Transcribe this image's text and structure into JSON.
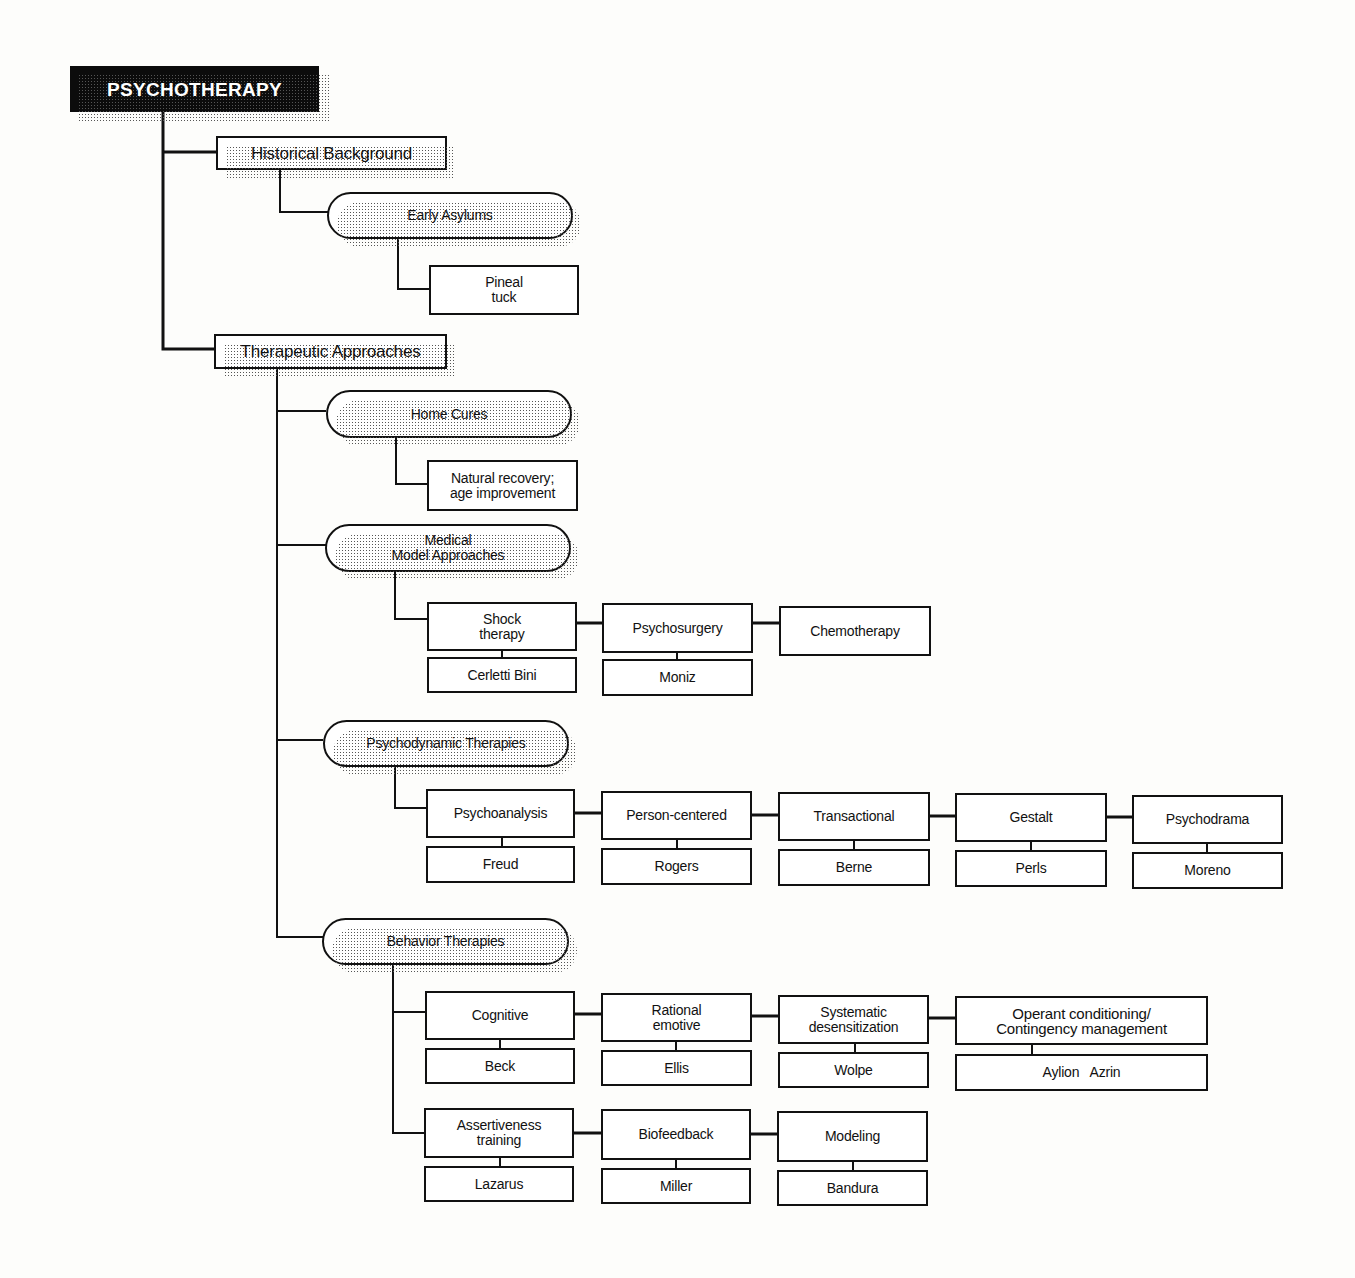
{
  "diagram": {
    "root": "PSYCHOTHERAPY",
    "historical": {
      "label": "Historical Background",
      "early_asylums": {
        "label": "Early Asylums",
        "child": "Pineal\ntuck"
      }
    },
    "therapeutic": {
      "label": "Therapeutic Approaches",
      "home_cures": {
        "label": "Home Cures",
        "child": "Natural recovery;\nage improvement"
      },
      "medical": {
        "label": "Medical\nModel Approaches",
        "methods": [
          {
            "label": "Shock\ntherapy",
            "person": "Cerletti Bini"
          },
          {
            "label": "Psychosurgery",
            "person": "Moniz"
          },
          {
            "label": "Chemotherapy"
          }
        ]
      },
      "psychodynamic": {
        "label": "Psychodynamic Therapies",
        "methods": [
          {
            "label": "Psychoanalysis",
            "person": "Freud"
          },
          {
            "label": "Person-centered",
            "person": "Rogers"
          },
          {
            "label": "Transactional",
            "person": "Berne"
          },
          {
            "label": "Gestalt",
            "person": "Perls"
          },
          {
            "label": "Psychodrama",
            "person": "Moreno"
          }
        ]
      },
      "behavior": {
        "label": "Behavior Therapies",
        "methods": [
          {
            "label": "Cognitive",
            "person": "Beck"
          },
          {
            "label": "Rational\nemotive",
            "person": "Ellis"
          },
          {
            "label": "Systematic\ndesensitization",
            "person": "Wolpe"
          },
          {
            "label": "Operant conditioning/\nContingency management",
            "person": "Aylion   Azrin"
          },
          {
            "label": "Assertiveness\ntraining",
            "person": "Lazarus"
          },
          {
            "label": "Biofeedback",
            "person": "Miller"
          },
          {
            "label": "Modeling",
            "person": "Bandura"
          }
        ]
      }
    }
  }
}
